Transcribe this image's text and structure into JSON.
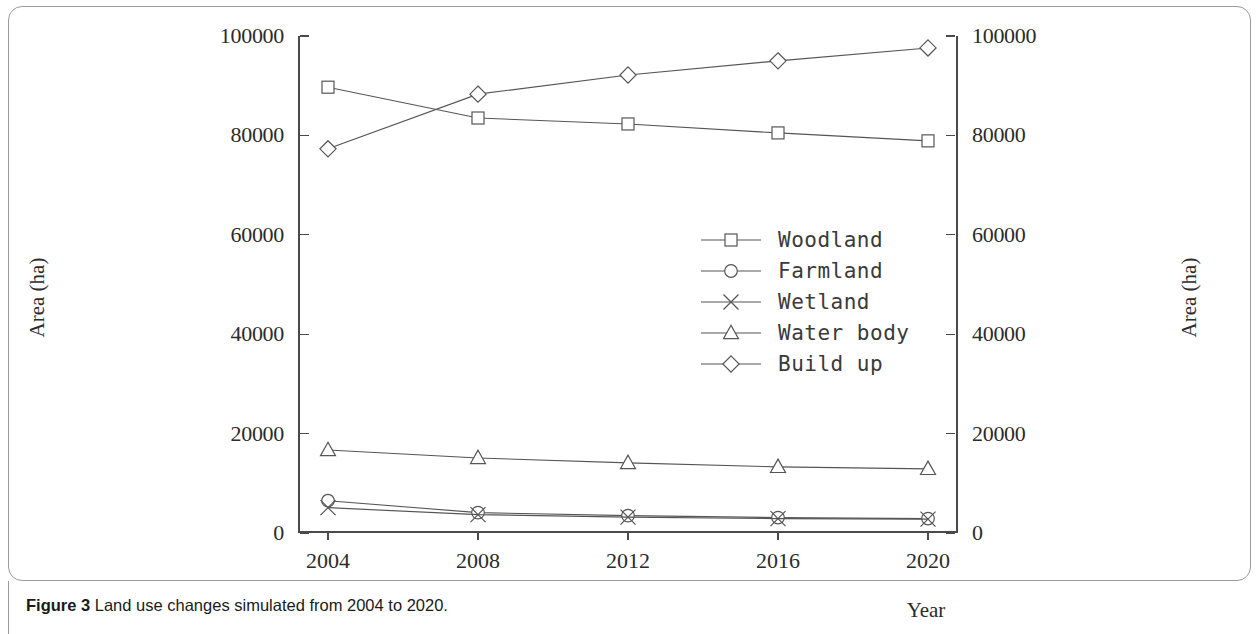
{
  "caption": {
    "prefix": "Figure 3",
    "text": " Land use changes simulated from 2004 to 2020."
  },
  "chart_data": {
    "type": "line",
    "title": "",
    "xlabel": "Year",
    "ylabel": "Area (ha)",
    "ylabel_right": "Area (ha)",
    "categories": [
      "2004",
      "2008",
      "2012",
      "2016",
      "2020"
    ],
    "x": [
      2004,
      2008,
      2012,
      2016,
      2020
    ],
    "ylim": [
      0,
      100000
    ],
    "yticks": [
      "0",
      "20000",
      "40000",
      "60000",
      "80000",
      "100000"
    ],
    "ytick_values": [
      0,
      20000,
      40000,
      60000,
      80000,
      100000
    ],
    "ylim_right": [
      0,
      100000
    ],
    "yticks_right": [
      "0",
      "20000",
      "40000",
      "60000",
      "80000",
      "100000"
    ],
    "grid": false,
    "legend_position": "center",
    "series": [
      {
        "name": "Woodland",
        "marker": "square",
        "values": [
          89700,
          83500,
          82300,
          80500,
          78900
        ]
      },
      {
        "name": "Farmland",
        "marker": "circle",
        "values": [
          6500,
          4100,
          3500,
          3100,
          2900
        ]
      },
      {
        "name": "Wetland",
        "marker": "cross",
        "values": [
          5100,
          3700,
          3200,
          2900,
          2800
        ]
      },
      {
        "name": "Water body",
        "marker": "triangle",
        "values": [
          16700,
          15100,
          14100,
          13300,
          12900
        ]
      },
      {
        "name": "Build up",
        "marker": "diamond",
        "values": [
          77300,
          88300,
          92150,
          95000,
          97600
        ]
      }
    ]
  },
  "colors": {
    "line": "#555555",
    "axis": "#4a4a4a",
    "frame": "#9a9a9a",
    "text": "#2b2b2b"
  }
}
